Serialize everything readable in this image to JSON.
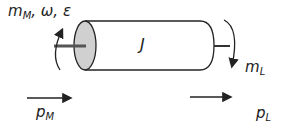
{
  "diagram": {
    "labels": {
      "motor_torque": "m",
      "motor_torque_sub": "M",
      "motor_extra": ", ω, ε",
      "inertia": "J",
      "load_torque": "m",
      "load_torque_sub": "L",
      "motor_power": "p",
      "motor_power_sub": "M",
      "load_power": "p",
      "load_power_sub": "L"
    },
    "colors": {
      "stroke": "#222222",
      "face_fill": "#d0d0d0",
      "shaft": "#555555"
    }
  }
}
